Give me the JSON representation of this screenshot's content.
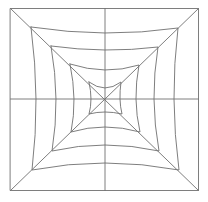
{
  "diagram": {
    "type": "concentric-square-web",
    "stroke_color": "#6f6f6f",
    "background": "#ffffff",
    "stroke_width": 0.9,
    "outer_square": {
      "x1": 10.5,
      "y1": 8.5,
      "x2": 198.5,
      "y2": 190.5
    },
    "center": {
      "x": 105,
      "y": 99
    },
    "center_lines": {
      "vertical_x": 105,
      "horizontal_y": 99
    },
    "diagonals": [
      {
        "from": [
          10.5,
          8.5
        ],
        "to": [
          198.5,
          190.5
        ]
      },
      {
        "from": [
          198.5,
          8.5
        ],
        "to": [
          10.5,
          190.5
        ]
      }
    ],
    "rings": [
      {
        "corners": {
          "tl": [
            31,
            27
          ],
          "tr": [
            178,
            28
          ],
          "br": [
            179,
            170
          ],
          "bl": [
            32,
            170
          ]
        },
        "mid": {
          "top": 33,
          "bottom": 163,
          "left": 36,
          "right": 174
        }
      },
      {
        "corners": {
          "tl": [
            51,
            46
          ],
          "tr": [
            158,
            47
          ],
          "br": [
            159,
            151
          ],
          "bl": [
            52,
            151
          ]
        },
        "mid": {
          "top": 50,
          "bottom": 145,
          "left": 56,
          "right": 154
        }
      },
      {
        "corners": {
          "tl": [
            70,
            64
          ],
          "tr": [
            139,
            65
          ],
          "br": [
            140,
            132
          ],
          "bl": [
            71,
            132
          ]
        },
        "mid": {
          "top": 70,
          "bottom": 127,
          "left": 74,
          "right": 136
        }
      },
      {
        "corners": {
          "tl": [
            89,
            82
          ],
          "tr": [
            121,
            82
          ],
          "br": [
            122,
            114
          ],
          "bl": [
            89,
            114
          ]
        },
        "mid": {
          "top": 88,
          "bottom": 112,
          "left": 91,
          "right": 120
        }
      }
    ]
  }
}
